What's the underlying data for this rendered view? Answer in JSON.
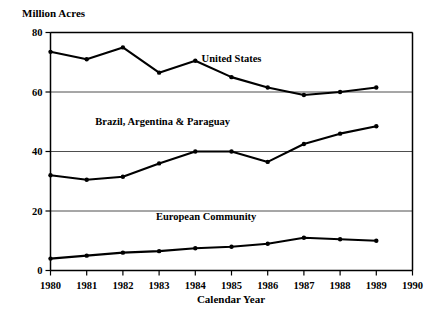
{
  "chart_data": {
    "type": "line",
    "title": "",
    "ylabel": "Million Acres",
    "xlabel": "Calendar Year",
    "ylim": [
      0,
      80
    ],
    "xlim": [
      1980,
      1990
    ],
    "yticks": [
      "0",
      "20",
      "40",
      "60",
      "80"
    ],
    "ytick_values": [
      0,
      20,
      40,
      60,
      80
    ],
    "grid": true,
    "grid_axis": "y",
    "legend_position": "inline-labels",
    "categories": [
      1980,
      1981,
      1982,
      1983,
      1984,
      1985,
      1986,
      1987,
      1988,
      1989
    ],
    "xticks": [
      "1980",
      "1981",
      "1982",
      "1983",
      "1984",
      "1985",
      "1986",
      "1987",
      "1988",
      "1989",
      "1990"
    ],
    "xtick_values": [
      1980,
      1981,
      1982,
      1983,
      1984,
      1985,
      1986,
      1987,
      1988,
      1989,
      1990
    ],
    "series": [
      {
        "name": "United States",
        "label_x": 1985.0,
        "label_y": 70.0,
        "values": [
          73.5,
          71.0,
          75.0,
          66.5,
          70.5,
          65.0,
          61.5,
          59.0,
          60.0,
          61.5
        ]
      },
      {
        "name": "Brazil, Argentina & Paraguay",
        "label_x": 1983.1,
        "label_y": 49.0,
        "values": [
          32.0,
          30.5,
          31.5,
          36.0,
          40.0,
          40.0,
          36.5,
          42.5,
          46.0,
          48.5
        ]
      },
      {
        "name": "European Community",
        "label_x": 1984.3,
        "label_y": 17.0,
        "values": [
          4.0,
          5.0,
          6.0,
          6.5,
          7.5,
          8.0,
          9.0,
          11.0,
          10.5,
          10.0
        ]
      }
    ]
  },
  "axes": {
    "y_axis_title": "Million Acres",
    "x_axis_title": "Calendar Year"
  }
}
